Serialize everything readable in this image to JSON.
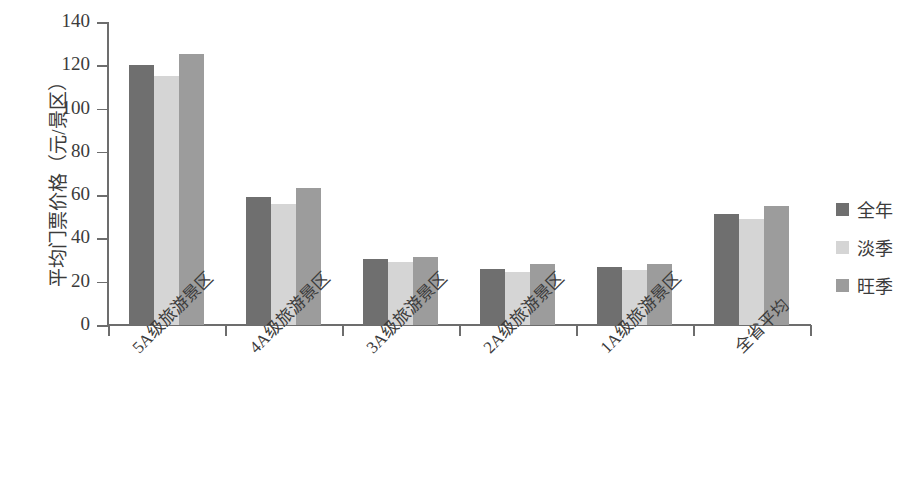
{
  "chart_data": {
    "type": "bar",
    "title": "",
    "xlabel": "",
    "ylabel": "平均门票价格（元/景区）",
    "ylim": [
      0,
      140
    ],
    "ytick_values": [
      0,
      20,
      40,
      60,
      80,
      100,
      120,
      140
    ],
    "ytick_labels": [
      "0",
      "20",
      "40",
      "60",
      "80",
      "100",
      "120",
      "140"
    ],
    "grid": false,
    "legend_position": "right",
    "categories": [
      "5A级旅游景区",
      "4A级旅游景区",
      "3A级旅游景区",
      "2A级旅游景区",
      "1A级旅游景区",
      "全省平均"
    ],
    "series": [
      {
        "name": "全年",
        "color": "#6f6f6f",
        "values": [
          120,
          59,
          30.5,
          26,
          27,
          51.5
        ]
      },
      {
        "name": "淡季",
        "color": "#d5d5d5",
        "values": [
          115,
          56,
          29,
          24.5,
          25.5,
          49
        ]
      },
      {
        "name": "旺季",
        "color": "#9c9c9c",
        "values": [
          125,
          63.5,
          31.5,
          28,
          28,
          55
        ]
      }
    ]
  },
  "axis": {
    "line_color": "#6d6d6d"
  }
}
